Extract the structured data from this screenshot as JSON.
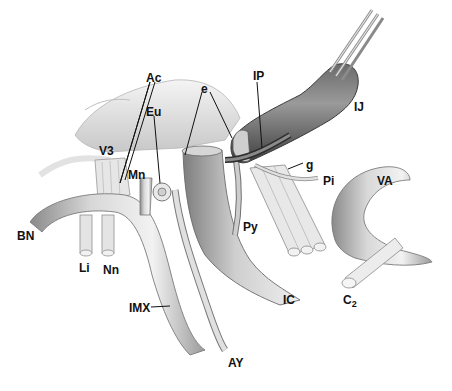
{
  "figure": {
    "type": "anatomical-illustration",
    "background": "#ffffff",
    "tone": "grayscale",
    "labels": [
      {
        "id": "Ac",
        "text": "Ac",
        "x": 146,
        "y": 72
      },
      {
        "id": "e",
        "text": "e",
        "x": 201,
        "y": 83
      },
      {
        "id": "IP",
        "text": "IP",
        "x": 253,
        "y": 70
      },
      {
        "id": "IJ",
        "text": "IJ",
        "x": 354,
        "y": 101
      },
      {
        "id": "Eu",
        "text": "Eu",
        "x": 146,
        "y": 106
      },
      {
        "id": "V3",
        "text": "V3",
        "x": 99,
        "y": 145
      },
      {
        "id": "Mn",
        "text": "Mn",
        "x": 128,
        "y": 169
      },
      {
        "id": "g",
        "text": "g",
        "x": 306,
        "y": 159
      },
      {
        "id": "Pi",
        "text": "Pi",
        "x": 323,
        "y": 175
      },
      {
        "id": "VA",
        "text": "VA",
        "x": 377,
        "y": 175
      },
      {
        "id": "Py",
        "text": "Py",
        "x": 243,
        "y": 221
      },
      {
        "id": "BN",
        "text": "BN",
        "x": 17,
        "y": 230
      },
      {
        "id": "Li",
        "text": "Li",
        "x": 79,
        "y": 262
      },
      {
        "id": "Nn",
        "text": "Nn",
        "x": 103,
        "y": 264
      },
      {
        "id": "IC",
        "text": "IC",
        "x": 283,
        "y": 294
      },
      {
        "id": "C2",
        "text": "C",
        "sub": "2",
        "x": 343,
        "y": 294
      },
      {
        "id": "IMX",
        "text": "IMX",
        "x": 129,
        "y": 302
      },
      {
        "id": "AY",
        "text": "AY",
        "x": 228,
        "y": 357
      }
    ]
  }
}
